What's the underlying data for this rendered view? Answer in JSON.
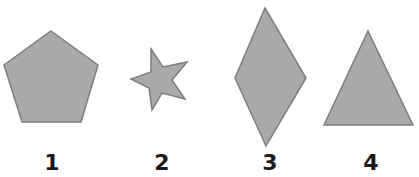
{
  "figure": {
    "fill_color": "#a9a9a9",
    "stroke_color": "#7d7d7d",
    "label_color": "#1a1a1a",
    "background_color": "#ffffff",
    "shapes": [
      {
        "id": "pentagon",
        "kind": "pentagon",
        "label": "1"
      },
      {
        "id": "star",
        "kind": "star",
        "label": "2"
      },
      {
        "id": "rhombus",
        "kind": "rhombus",
        "label": "3"
      },
      {
        "id": "triangle",
        "kind": "triangle",
        "label": "4"
      }
    ]
  }
}
